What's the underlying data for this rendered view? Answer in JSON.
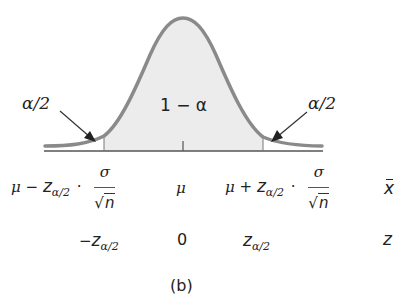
{
  "figure": {
    "panel_label": "(b)",
    "region_labels": {
      "left_tail": "α/2",
      "center": "1 − α",
      "right_tail": "α/2"
    },
    "xbar_axis": {
      "lower": {
        "mu": "μ",
        "op": "−",
        "z": "z",
        "sub": "α/2",
        "dot": "·",
        "num": "σ",
        "sqrt": "√",
        "den": "n"
      },
      "center": "μ",
      "upper": {
        "mu": "μ",
        "op": "+",
        "z": "z",
        "sub": "α/2",
        "dot": "·",
        "num": "σ",
        "sqrt": "√",
        "den": "n"
      },
      "axis_name": "x"
    },
    "z_axis": {
      "lower": {
        "prefix": "−",
        "z": "z",
        "sub": "α/2"
      },
      "center": "0",
      "upper": {
        "z": "z",
        "sub": "α/2"
      },
      "axis_name": "z"
    },
    "colors": {
      "curve": "#8a8a8a",
      "shade": "#ececec",
      "axis": "#555555",
      "arrow": "#333333"
    }
  }
}
